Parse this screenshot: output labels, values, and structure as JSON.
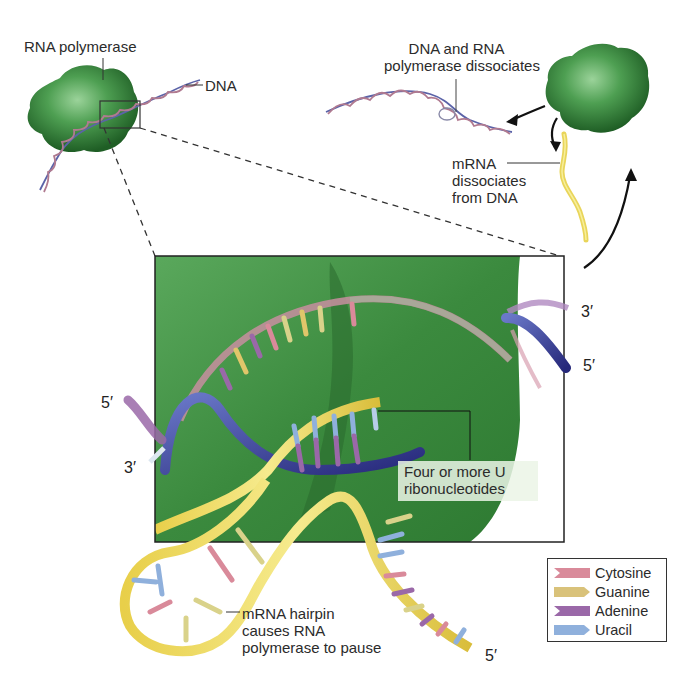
{
  "figure": {
    "labels": {
      "rna_polymerase": "RNA polymerase",
      "dna": "DNA",
      "dna_rnap_dissociates": [
        "DNA and RNA",
        "polymerase dissociates"
      ],
      "mrna_dissociates": [
        "mRNA",
        "dissociates",
        "from DNA"
      ],
      "four_u": [
        "Four or more U",
        "ribonucleotides"
      ],
      "hairpin": [
        "mRNA hairpin",
        "causes RNA",
        "polymerase to pause"
      ]
    },
    "strand_ends": {
      "left_5": "5′",
      "left_3": "3′",
      "right_3": "3′",
      "right_5": "5′",
      "mrna_5": "5′"
    }
  },
  "legend": {
    "items": [
      {
        "label": "Cytosine",
        "color": "#d98a9a",
        "shape": "notched"
      },
      {
        "label": "Guanine",
        "color": "#d9c27a",
        "shape": "pointed"
      },
      {
        "label": "Adenine",
        "color": "#9a68a8",
        "shape": "notched"
      },
      {
        "label": "Uracil",
        "color": "#8fb0dc",
        "shape": "pointed"
      }
    ]
  },
  "colors": {
    "polymerase_green": "#3f8f45",
    "panel_green": "#3e8a3f",
    "mrna_yellow": "#e9d55a",
    "dna_blue": "#3a3f9a",
    "dna_pink": "#d79aa8",
    "dna_purple": "#9a6aa8"
  }
}
